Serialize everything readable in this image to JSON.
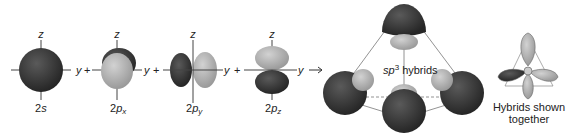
{
  "orbitals": [
    {
      "id": "2s",
      "label_main": "2",
      "label_ital": "s",
      "label_sub": ""
    },
    {
      "id": "2px",
      "label_main": "2",
      "label_ital": "p",
      "label_sub": "x"
    },
    {
      "id": "2py",
      "label_main": "2",
      "label_ital": "p",
      "label_sub": "y"
    },
    {
      "id": "2pz",
      "label_main": "2",
      "label_ital": "p",
      "label_sub": "z"
    }
  ],
  "axes": {
    "z": "z",
    "y": "y"
  },
  "operators": {
    "plus": "+",
    "arrow": "→"
  },
  "hybrids": {
    "label_ital": "sp",
    "label_sup": "3",
    "label_rest": " hybrids"
  },
  "together": {
    "line1": "Hybrids shown",
    "line2": "together"
  },
  "colors": {
    "dark": "#3a3a3a",
    "light": "#b4b4b4",
    "axis": "#444444"
  }
}
